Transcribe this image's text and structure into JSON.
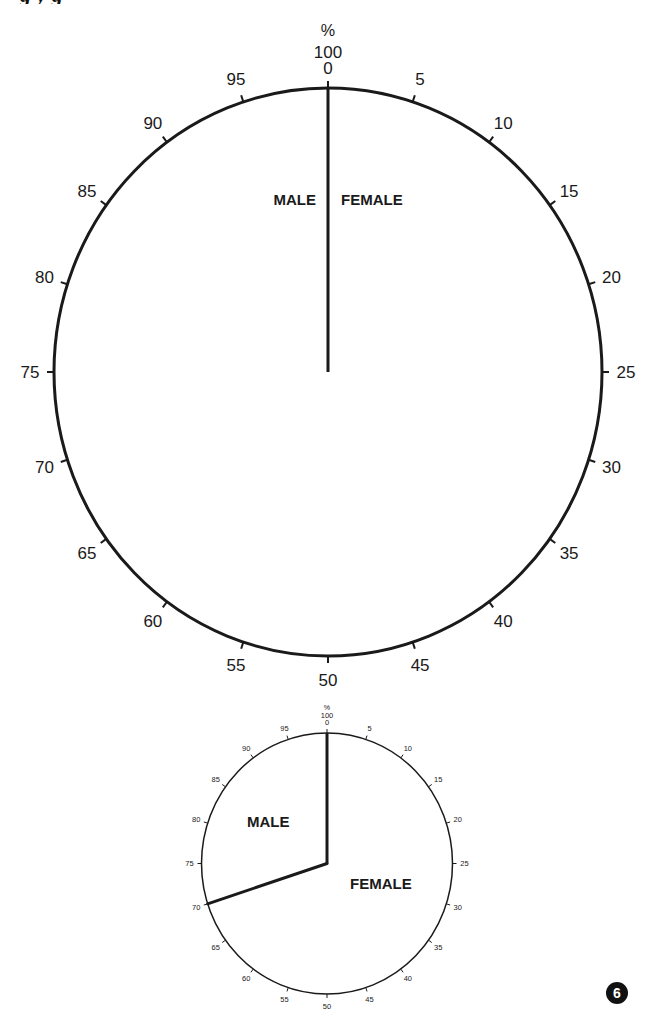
{
  "page": {
    "title_fragment": "g   y      g",
    "page_number": "6"
  },
  "chart_data": [
    {
      "type": "pie",
      "title": "",
      "unit_label": "%",
      "scale_top_labels": [
        "100",
        "0"
      ],
      "scale_ticks": [
        0,
        5,
        10,
        15,
        20,
        25,
        30,
        35,
        40,
        45,
        50,
        55,
        60,
        65,
        70,
        75,
        80,
        85,
        90,
        95
      ],
      "categories": [
        "FEMALE",
        "MALE"
      ],
      "values": [
        null,
        null
      ],
      "split_percent": 0,
      "note": "Blank template: only the 0/100 radius is drawn; labels MALE (left) and FEMALE (right) flank it.",
      "labels": {
        "male": "MALE",
        "female": "FEMALE"
      }
    },
    {
      "type": "pie",
      "title": "",
      "unit_label": "%",
      "scale_top_labels": [
        "100",
        "0"
      ],
      "scale_ticks": [
        0,
        5,
        10,
        15,
        20,
        25,
        30,
        35,
        40,
        45,
        50,
        55,
        60,
        65,
        70,
        75,
        80,
        85,
        90,
        95
      ],
      "categories": [
        "FEMALE",
        "MALE"
      ],
      "values": [
        70,
        30
      ],
      "split_percent": 70,
      "labels": {
        "male": "MALE",
        "female": "FEMALE"
      }
    }
  ],
  "colors": {
    "ink": "#1a1a1a",
    "background": "#ffffff",
    "badge": "#111111"
  }
}
